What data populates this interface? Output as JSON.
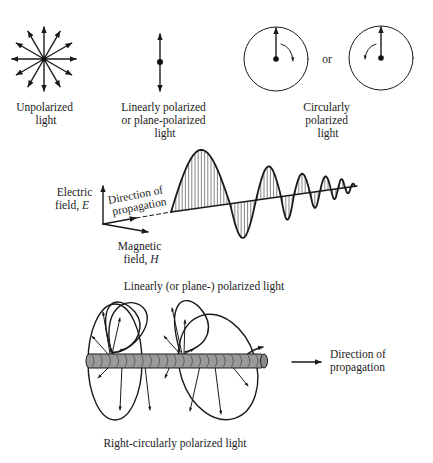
{
  "figure": {
    "colors": {
      "ink": "#1a1a1a",
      "text": "#222222",
      "rod_fill": "#9a9a9a",
      "rod_band": "#6e6e6e",
      "background": "#ffffff"
    },
    "top_row": {
      "unpolarized": {
        "label_lines": [
          "Unpolarized",
          "light"
        ],
        "arrow_count": 12
      },
      "linear": {
        "label_lines": [
          "Linearly polarized",
          "or plane-polarized",
          "light"
        ]
      },
      "circular": {
        "separator": "or",
        "label_lines": [
          "Circularly",
          "polarized",
          "light"
        ],
        "rotations": [
          "clockwise",
          "counterclockwise"
        ]
      }
    },
    "linear_wave": {
      "electric_label_lines": [
        "Electric",
        "field, "
      ],
      "electric_symbol": "E",
      "propagation_label_lines": [
        "Direction of",
        "propagation"
      ],
      "magnetic_label_lines": [
        "Magnetic",
        "field, "
      ],
      "magnetic_symbol": "H",
      "caption": "Linearly (or plane-) polarized light"
    },
    "circular_wave": {
      "propagation_label_lines": [
        "Direction of",
        "propagation"
      ],
      "caption": "Right-circularly polarized light"
    }
  }
}
